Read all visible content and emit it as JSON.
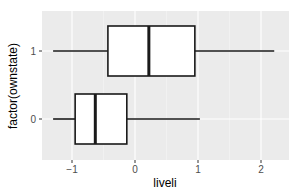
{
  "chart_data": {
    "type": "boxplot",
    "orientation": "horizontal",
    "title": "",
    "xlabel": "liveli",
    "ylabel": "factor(ownstate)",
    "xlim": [
      -1.5,
      2.4
    ],
    "x_ticks": [
      -1,
      0,
      1,
      2
    ],
    "x_tick_labels": [
      "-1",
      "0",
      "1",
      "2"
    ],
    "categories": [
      "0",
      "1"
    ],
    "series": [
      {
        "name": "0",
        "whisker_low": -1.3,
        "q1": -0.95,
        "median": -0.63,
        "q3": -0.13,
        "whisker_high": 1.03
      },
      {
        "name": "1",
        "whisker_low": -1.3,
        "q1": -0.43,
        "median": 0.22,
        "q3": 0.95,
        "whisker_high": 2.21
      }
    ],
    "grid": true,
    "legend": "none",
    "panel_background": "#ebebeb",
    "grid_color": "#ffffff"
  }
}
